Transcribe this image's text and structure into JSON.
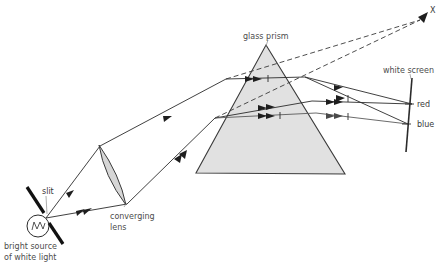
{
  "diagram": {
    "title_visible": false,
    "background_color": "#ffffff",
    "ink_color": "#2b2b2b",
    "label_color": "#4c4c4c",
    "prism_fill": "#dcdcdc",
    "lens_fill": "#d2d2d2"
  },
  "labels": {
    "source": {
      "line1": "bright source",
      "line2": "of white light",
      "x": 4,
      "y": 243
    },
    "slit": {
      "text": "slit",
      "x": 42,
      "y": 193
    },
    "lens": {
      "line1": "converging",
      "line2": "lens",
      "x": 110,
      "y": 216
    },
    "prism": {
      "text": "glass prism",
      "x": 243,
      "y": 38
    },
    "screen": {
      "text": "white screen",
      "x": 383,
      "y": 72
    },
    "red": {
      "text": "red",
      "x": 416,
      "y": 107
    },
    "blue": {
      "text": "blue",
      "x": 416,
      "y": 126
    },
    "virtual_point": {
      "text": "X",
      "x": 429,
      "y": 12
    }
  },
  "components": {
    "lamp": {
      "name": "bright-source-of-white-light",
      "center_x": 38,
      "center_y": 226,
      "radius": 11
    },
    "slit_barrier": {
      "name": "slit-barrier",
      "upper_segment": {
        "x1": 26,
        "y1": 186,
        "x2": 44,
        "y2": 214
      },
      "lower_segment": {
        "x1": 48,
        "y1": 222,
        "x2": 62,
        "y2": 245
      },
      "slit_gap_x": 46,
      "slit_gap_y": 218
    },
    "converging_lens": {
      "name": "converging-lens",
      "top_x": 99,
      "top_y": 145,
      "bottom_x": 126,
      "bottom_y": 205
    },
    "glass_prism": {
      "name": "glass-prism",
      "apex_x": 266,
      "apex_y": 45,
      "bottom_left_x": 196,
      "bottom_left_y": 173,
      "bottom_right_x": 345,
      "bottom_right_y": 174
    },
    "white_screen": {
      "name": "white-screen",
      "top_x": 411,
      "top_y": 78,
      "bottom_x": 406,
      "bottom_y": 152
    }
  },
  "rays": {
    "incident_upper": {
      "name": "upper-incident-ray",
      "from": "slit",
      "to": "lens-top",
      "points": "46,218 99,147"
    },
    "incident_lower": {
      "name": "lower-incident-ray",
      "from": "slit",
      "to": "lens-bottom",
      "points": "46,218 126,204"
    },
    "lens_to_prism_upper": {
      "name": "upper-ray-lens-to-prism",
      "points": "99,147 224,80"
    },
    "lens_to_prism_lower": {
      "name": "lower-ray-lens-to-prism",
      "points": "126,204 214,119"
    },
    "inside_prism_upper": {
      "name": "upper-ray-inside-prism",
      "points": "224,80 303,78"
    },
    "inside_prism_lower": {
      "name": "lower-ray-inside-prism",
      "points": "214,119 311,102"
    },
    "exit_red_upper": {
      "name": "red-ray-exit-upper",
      "points": "303,78 411,104"
    },
    "exit_blue_upper": {
      "name": "blue-ray-exit-upper",
      "points": "303,78 408,124"
    },
    "exit_red_lower": {
      "name": "red-ray-exit-lower",
      "points": "311,102 411,104"
    },
    "exit_blue_lower": {
      "name": "blue-ray-exit-lower",
      "points": "311,113 408,124"
    },
    "virtual_dashed_upper": {
      "name": "virtual-ray-dashed-upper",
      "points": "224,80 424,18"
    },
    "virtual_dashed_lower": {
      "name": "virtual-ray-dashed-lower",
      "points": "214,119 424,18"
    }
  },
  "colors": {
    "red_label": "#3a3a3a",
    "blue_label": "#3a3a3a",
    "ray_stroke": "#2b2b2b",
    "dashed_stroke": "#3a3a3a"
  }
}
